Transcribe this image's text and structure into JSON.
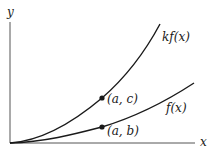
{
  "diagram": {
    "axes": {
      "x_label": "x",
      "y_label": "y"
    },
    "curves": [
      {
        "name": "kf(x)",
        "label": "kf(x)"
      },
      {
        "name": "f(x)",
        "label": "f(x)"
      }
    ],
    "points": [
      {
        "label": "(a, c)",
        "on": "kf(x)"
      },
      {
        "label": "(a, b)",
        "on": "f(x)"
      }
    ],
    "colors": {
      "stroke": "#1a1a1a",
      "axis": "#555555",
      "background": "#ffffff"
    }
  }
}
